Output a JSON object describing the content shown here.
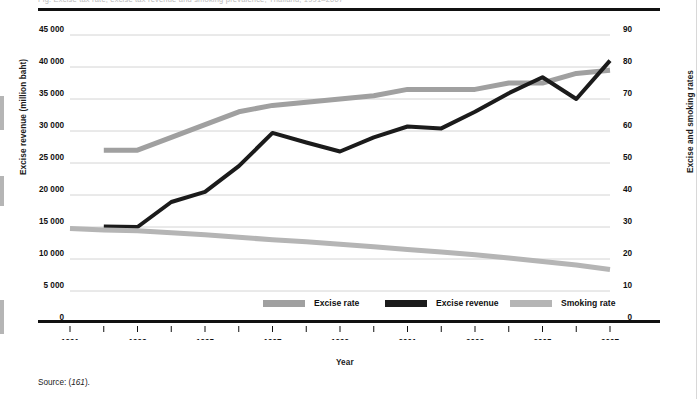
{
  "figure": {
    "clipped_caption": "Fig.  Excise tax rate, excise tax revenue and smoking prevalence, Thailand, 1991–2007",
    "source_prefix": "Source: (",
    "source_ref": "161",
    "source_suffix": ").",
    "colors": {
      "excise_rate": "#a0a0a0",
      "excise_revenue": "#1b1b1b",
      "smoking_rate": "#b5b5b5",
      "gridline": "#c9c9c9",
      "axis": "#111111"
    }
  },
  "chart_data": {
    "type": "line",
    "title": "",
    "xlabel": "Year",
    "ylabel": "Excise revenue (million baht)",
    "y2label": "Excise and smoking rates",
    "grid": true,
    "legend_position": "bottom",
    "xlim": [
      1991,
      2007
    ],
    "ylim": [
      0,
      45000
    ],
    "y2lim": [
      0,
      90
    ],
    "x": [
      1991,
      1992,
      1993,
      1994,
      1995,
      1996,
      1997,
      1998,
      1999,
      2000,
      2001,
      2002,
      2003,
      2004,
      2005,
      2006,
      2007
    ],
    "xticks": [
      1991,
      1992,
      1993,
      1994,
      1995,
      1996,
      1997,
      1998,
      1999,
      2000,
      2001,
      2002,
      2003,
      2004,
      2005,
      2006,
      2007
    ],
    "xtick_labels": [
      "1991",
      "",
      "1993",
      "",
      "1995",
      "",
      "1997",
      "",
      "1999",
      "",
      "2001",
      "",
      "2003",
      "",
      "2005",
      "",
      "2007"
    ],
    "yticks": [
      0,
      5000,
      10000,
      15000,
      20000,
      25000,
      30000,
      35000,
      40000,
      45000
    ],
    "ytick_labels": [
      "0",
      "5 000",
      "10 000",
      "15 000",
      "20 000",
      "25 000",
      "30 000",
      "35 000",
      "40 000",
      "45 000"
    ],
    "y2ticks": [
      0,
      10,
      20,
      30,
      40,
      50,
      60,
      70,
      80,
      90
    ],
    "y2tick_labels": [
      "0",
      "10",
      "20",
      "30",
      "40",
      "50",
      "60",
      "70",
      "80",
      "90"
    ],
    "series": [
      {
        "name": "Excise rate",
        "axis": "right",
        "color": "#a0a0a0",
        "width": 5,
        "x": [
          1992,
          1993,
          1994,
          1995,
          1996,
          1997,
          1998,
          1999,
          2000,
          2001,
          2002,
          2003,
          2004,
          2005,
          2006,
          2007
        ],
        "values": [
          54,
          54,
          58,
          62,
          66,
          68,
          69,
          70,
          71,
          73,
          73,
          73,
          75,
          75,
          78,
          79
        ]
      },
      {
        "name": "Excise revenue",
        "axis": "left",
        "color": "#1b1b1b",
        "width": 4,
        "x": [
          1992,
          1993,
          1994,
          1995,
          1996,
          1997,
          1998,
          1999,
          2000,
          2001,
          2002,
          2003,
          2004,
          2005,
          2006,
          2007
        ],
        "values": [
          15100,
          15000,
          18900,
          20500,
          24500,
          29700,
          28200,
          26800,
          29000,
          30700,
          30400,
          33000,
          35900,
          38400,
          35000,
          41000
        ]
      },
      {
        "name": "Smoking rate",
        "axis": "right",
        "color": "#b5b5b5",
        "width": 5,
        "x": [
          1991,
          1992,
          1993,
          1994,
          1995,
          1996,
          1997,
          1998,
          1999,
          2000,
          2001,
          2002,
          2003,
          2004,
          2005,
          2006,
          2007
        ],
        "values": [
          29.5,
          29.1,
          28.8,
          28.2,
          27.6,
          26.8,
          26.0,
          25.4,
          24.6,
          23.8,
          23.0,
          22.2,
          21.3,
          20.3,
          19.2,
          18.1,
          16.7
        ]
      }
    ],
    "legend": [
      {
        "label": "Excise rate",
        "color": "#a0a0a0"
      },
      {
        "label": "Excise revenue",
        "color": "#1b1b1b"
      },
      {
        "label": "Smoking rate",
        "color": "#b5b5b5"
      }
    ]
  }
}
